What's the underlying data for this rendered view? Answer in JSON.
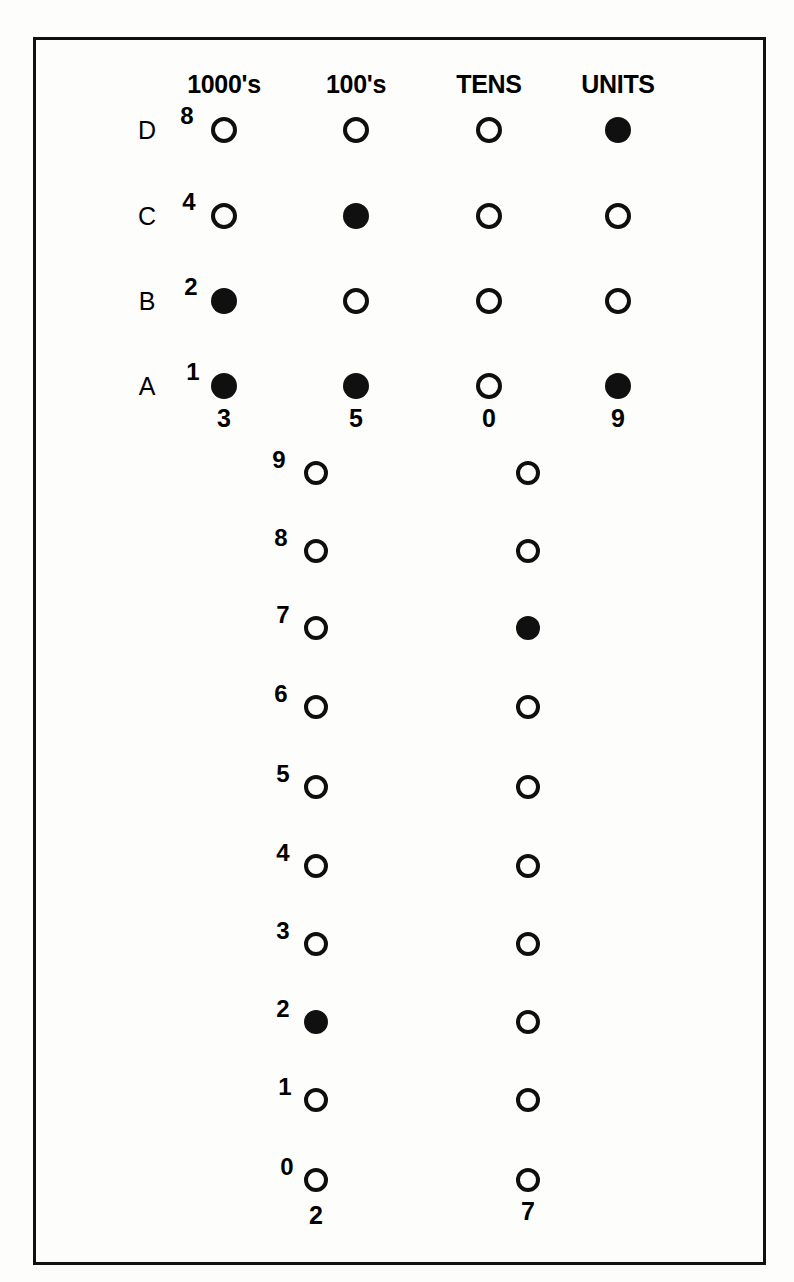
{
  "figure": {
    "type": "punched-card-style bit matrix diagram",
    "column_headers": [
      "1000's",
      "100's",
      "TENS",
      "UNITS"
    ],
    "row_letters": [
      "D",
      "C",
      "B",
      "A"
    ],
    "row_weights": [
      "8",
      "4",
      "2",
      "1"
    ],
    "upper_result_digits": [
      "3",
      "5",
      "0",
      "9"
    ],
    "lower_column_headers": [
      "100's",
      "TENS"
    ],
    "lower_scale_digits": [
      "9",
      "8",
      "7",
      "6",
      "5",
      "4",
      "3",
      "2",
      "1",
      "0"
    ],
    "lower_result_digits": [
      "2",
      "7"
    ],
    "upper_matrix": [
      {
        "row_letter": "D",
        "weight": "8",
        "cells": [
          {
            "column": "1000's",
            "state": "open"
          },
          {
            "column": "100's",
            "state": "open"
          },
          {
            "column": "TENS",
            "state": "open"
          },
          {
            "column": "UNITS",
            "state": "filled"
          }
        ]
      },
      {
        "row_letter": "C",
        "weight": "4",
        "cells": [
          {
            "column": "1000's",
            "state": "open"
          },
          {
            "column": "100's",
            "state": "filled"
          },
          {
            "column": "TENS",
            "state": "open"
          },
          {
            "column": "UNITS",
            "state": "open"
          }
        ]
      },
      {
        "row_letter": "B",
        "weight": "2",
        "cells": [
          {
            "column": "1000's",
            "state": "filled"
          },
          {
            "column": "100's",
            "state": "open"
          },
          {
            "column": "TENS",
            "state": "open"
          },
          {
            "column": "UNITS",
            "state": "open"
          }
        ]
      },
      {
        "row_letter": "A",
        "weight": "1",
        "cells": [
          {
            "column": "1000's",
            "state": "filled"
          },
          {
            "column": "100's",
            "state": "filled"
          },
          {
            "column": "TENS",
            "state": "open"
          },
          {
            "column": "UNITS",
            "state": "filled"
          }
        ]
      }
    ],
    "lower_matrix": [
      {
        "digit": "9",
        "cells": [
          {
            "column": "100's",
            "state": "open"
          },
          {
            "column": "TENS",
            "state": "open"
          }
        ]
      },
      {
        "digit": "8",
        "cells": [
          {
            "column": "100's",
            "state": "open"
          },
          {
            "column": "TENS",
            "state": "open"
          }
        ]
      },
      {
        "digit": "7",
        "cells": [
          {
            "column": "100's",
            "state": "open"
          },
          {
            "column": "TENS",
            "state": "filled"
          }
        ]
      },
      {
        "digit": "6",
        "cells": [
          {
            "column": "100's",
            "state": "open"
          },
          {
            "column": "TENS",
            "state": "open"
          }
        ]
      },
      {
        "digit": "5",
        "cells": [
          {
            "column": "100's",
            "state": "open"
          },
          {
            "column": "TENS",
            "state": "open"
          }
        ]
      },
      {
        "digit": "4",
        "cells": [
          {
            "column": "100's",
            "state": "open"
          },
          {
            "column": "TENS",
            "state": "open"
          }
        ]
      },
      {
        "digit": "3",
        "cells": [
          {
            "column": "100's",
            "state": "open"
          },
          {
            "column": "TENS",
            "state": "open"
          }
        ]
      },
      {
        "digit": "2",
        "cells": [
          {
            "column": "100's",
            "state": "filled"
          },
          {
            "column": "TENS",
            "state": "open"
          }
        ]
      },
      {
        "digit": "1",
        "cells": [
          {
            "column": "100's",
            "state": "open"
          },
          {
            "column": "TENS",
            "state": "open"
          }
        ]
      },
      {
        "digit": "0",
        "cells": [
          {
            "column": "100's",
            "state": "open"
          },
          {
            "column": "TENS",
            "state": "open"
          }
        ]
      }
    ],
    "colors": {
      "ink": "#101010",
      "paper": "#fdfdfc",
      "frame": "#111111"
    }
  },
  "headers": [
    {
      "label": "1000's",
      "x": 224,
      "y": 72
    },
    {
      "label": "100's",
      "x": 356,
      "y": 72
    },
    {
      "label": "TENS",
      "x": 489,
      "y": 72
    },
    {
      "label": "UNITS",
      "x": 618,
      "y": 72
    }
  ],
  "upper_rows": [
    {
      "letter": "D",
      "weight": "8",
      "y": 130,
      "letter_x": 147,
      "weight_x": 187,
      "states": [
        "open",
        "open",
        "open",
        "filled"
      ]
    },
    {
      "letter": "C",
      "weight": "4",
      "y": 216,
      "letter_x": 147,
      "weight_x": 189,
      "states": [
        "open",
        "filled",
        "open",
        "open"
      ]
    },
    {
      "letter": "B",
      "weight": "2",
      "y": 301,
      "letter_x": 147,
      "weight_x": 191,
      "states": [
        "filled",
        "open",
        "open",
        "open"
      ]
    },
    {
      "letter": "A",
      "weight": "1",
      "y": 386,
      "letter_x": 147,
      "weight_x": 193,
      "states": [
        "filled",
        "filled",
        "open",
        "filled"
      ]
    }
  ],
  "upper_columns_x": [
    224,
    356,
    489,
    618
  ],
  "upper_results": [
    {
      "digit": "3",
      "x": 224,
      "y": 418
    },
    {
      "digit": "5",
      "x": 356,
      "y": 418
    },
    {
      "digit": "0",
      "x": 489,
      "y": 418
    },
    {
      "digit": "9",
      "x": 618,
      "y": 418
    }
  ],
  "lower_columns_x": [
    316,
    528
  ],
  "lower_rows": [
    {
      "digit": "9",
      "y": 473,
      "digit_x": 279,
      "states": [
        "open",
        "open"
      ]
    },
    {
      "digit": "8",
      "y": 551,
      "digit_x": 281,
      "states": [
        "open",
        "open"
      ]
    },
    {
      "digit": "7",
      "y": 628,
      "digit_x": 283,
      "states": [
        "open",
        "filled"
      ]
    },
    {
      "digit": "6",
      "y": 707,
      "digit_x": 281,
      "states": [
        "open",
        "open"
      ]
    },
    {
      "digit": "5",
      "y": 787,
      "digit_x": 283,
      "states": [
        "open",
        "open"
      ]
    },
    {
      "digit": "4",
      "y": 866,
      "digit_x": 283,
      "states": [
        "open",
        "open"
      ]
    },
    {
      "digit": "3",
      "y": 944,
      "digit_x": 283,
      "states": [
        "open",
        "open"
      ]
    },
    {
      "digit": "2",
      "y": 1022,
      "digit_x": 283,
      "states": [
        "filled",
        "open"
      ]
    },
    {
      "digit": "1",
      "y": 1100,
      "digit_x": 285,
      "states": [
        "open",
        "open"
      ]
    },
    {
      "digit": "0",
      "y": 1180,
      "digit_x": 287,
      "states": [
        "open",
        "open"
      ]
    }
  ],
  "lower_results": [
    {
      "digit": "2",
      "x": 316,
      "y": 1215
    },
    {
      "digit": "7",
      "x": 528,
      "y": 1211
    }
  ]
}
